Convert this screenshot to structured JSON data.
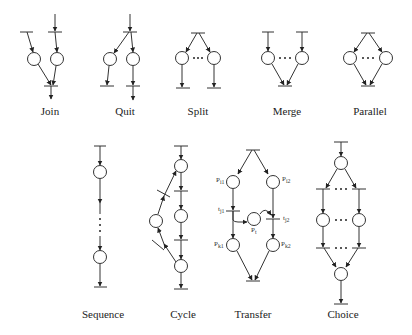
{
  "diagram": {
    "patterns": [
      {
        "id": "join",
        "label": "Join"
      },
      {
        "id": "quit",
        "label": "Quit"
      },
      {
        "id": "split",
        "label": "Split"
      },
      {
        "id": "merge",
        "label": "Merge"
      },
      {
        "id": "parallel",
        "label": "Parallel"
      },
      {
        "id": "sequence",
        "label": "Sequence"
      },
      {
        "id": "cycle",
        "label": "Cycle"
      },
      {
        "id": "transfer",
        "label": "Transfer"
      },
      {
        "id": "choice",
        "label": "Choice"
      }
    ],
    "transfer_labels": {
      "p_i1": "P",
      "p_i1_sub": "i1",
      "p_i2": "P",
      "p_i2_sub": "i2",
      "t_j1": "t",
      "t_j1_sub": "j1",
      "t_j2": "t",
      "t_j2_sub": "j2",
      "p_t": "P",
      "p_t_sub": "t",
      "p_k1": "P",
      "p_k1_sub": "k1",
      "p_k2": "P",
      "p_k2_sub": "k2"
    },
    "ellipsis": "..."
  }
}
